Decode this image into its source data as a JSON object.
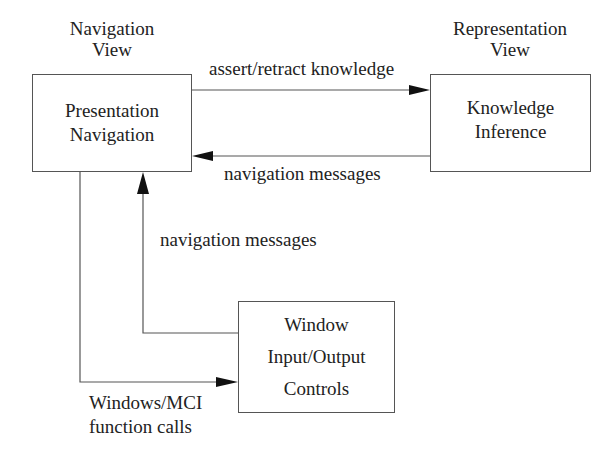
{
  "diagram": {
    "nodes": {
      "navigation": {
        "caption": [
          "Navigation",
          "View"
        ],
        "lines": [
          "Presentation",
          "Navigation"
        ]
      },
      "representation": {
        "caption": [
          "Representation",
          "View"
        ],
        "lines": [
          "Knowledge",
          "Inference"
        ]
      },
      "window": {
        "lines": [
          "Window",
          "Input/Output",
          "Controls"
        ]
      }
    },
    "edges": {
      "assert": {
        "label": "assert/retract knowledge",
        "from": "navigation",
        "to": "representation"
      },
      "nav_msgs_top": {
        "label": "navigation messages",
        "from": "representation",
        "to": "navigation"
      },
      "nav_msgs_bottom": {
        "label": "navigation messages",
        "from": "window",
        "to": "navigation"
      },
      "function_calls": {
        "label": [
          "Windows/MCI",
          "function calls"
        ],
        "from": "navigation",
        "to": "window"
      }
    },
    "colors": {
      "line": "#555555",
      "arrowhead": "#111111",
      "text": "#222222",
      "background": "#ffffff"
    }
  }
}
